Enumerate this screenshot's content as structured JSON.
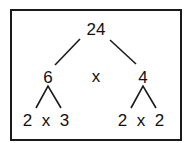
{
  "diagram": {
    "type": "factor-tree",
    "root": {
      "label": "24"
    },
    "level1": {
      "left": {
        "label": "6"
      },
      "operator": {
        "label": "x"
      },
      "right": {
        "label": "4"
      }
    },
    "level2": {
      "left": {
        "label": "2  x  3"
      },
      "right": {
        "label": "2  x  2"
      }
    },
    "colors": {
      "stroke": "#1a1a1a",
      "text": "#111111",
      "background": "#ffffff"
    }
  }
}
